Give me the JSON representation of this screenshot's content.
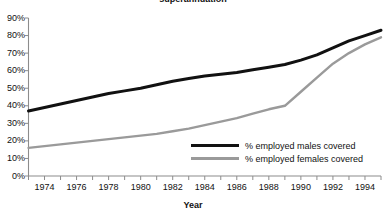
{
  "chart_data": {
    "type": "line",
    "title": "superannuation",
    "xlabel": "Year",
    "ylabel": "",
    "xlim": [
      1973,
      1995
    ],
    "ylim": [
      0,
      90
    ],
    "grid": false,
    "legend_position": "inside-lower-right",
    "x_tick_labels": [
      "1974",
      "1976",
      "1978",
      "1980",
      "1982",
      "1984",
      "1986",
      "1988",
      "1990",
      "1992",
      "1994"
    ],
    "x_tick_values": [
      1974,
      1976,
      1978,
      1980,
      1982,
      1984,
      1986,
      1988,
      1990,
      1992,
      1994
    ],
    "x_minor_ticks": [
      1973,
      1974,
      1975,
      1976,
      1977,
      1978,
      1979,
      1980,
      1981,
      1982,
      1983,
      1984,
      1985,
      1986,
      1987,
      1988,
      1989,
      1990,
      1991,
      1992,
      1993,
      1994,
      1995
    ],
    "y_tick_labels": [
      "0%",
      "10%",
      "20%",
      "30%",
      "40%",
      "50%",
      "60%",
      "70%",
      "80%",
      "90%"
    ],
    "y_tick_values": [
      0,
      10,
      20,
      30,
      40,
      50,
      60,
      70,
      80,
      90
    ],
    "x": [
      1973,
      1974,
      1975,
      1976,
      1977,
      1978,
      1979,
      1980,
      1981,
      1982,
      1983,
      1984,
      1985,
      1986,
      1987,
      1988,
      1989,
      1990,
      1991,
      1992,
      1993,
      1994,
      1995
    ],
    "series": [
      {
        "name": "% employed males covered",
        "color": "#111111",
        "values": [
          37,
          39,
          41,
          43,
          45,
          47,
          48.5,
          50,
          52,
          54,
          55.5,
          57,
          58,
          59,
          60.5,
          62,
          63.5,
          66,
          69,
          73,
          77,
          80,
          83
        ]
      },
      {
        "name": "% employed females covered",
        "color": "#9a9a9a",
        "values": [
          16,
          17,
          18,
          19,
          20,
          21,
          22,
          23,
          24,
          25.5,
          27,
          29,
          31,
          33,
          35.5,
          38,
          40,
          48,
          56,
          64,
          70,
          75,
          79
        ]
      }
    ]
  },
  "legend": {
    "items": [
      {
        "label": "% employed males covered",
        "color": "#111111"
      },
      {
        "label": "% employed females covered",
        "color": "#9a9a9a"
      }
    ]
  },
  "axes": {
    "x_title": "Year"
  }
}
